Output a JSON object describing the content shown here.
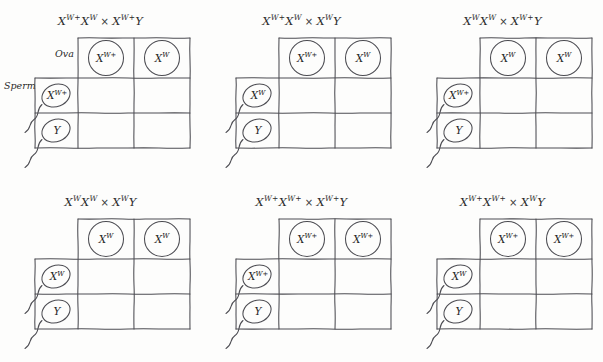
{
  "figure": {
    "title_style": "handwritten-genetics-punnett-squares",
    "columns": 3,
    "rows": 2,
    "axis_labels": {
      "ova": "Ova",
      "sperm": "Sperm"
    },
    "cross_symbol": "×",
    "colors": {
      "ink": "#4c4c52",
      "text": "#1f1f1f",
      "background": "#fdfdfc"
    }
  },
  "panels": [
    {
      "id": "panel-1",
      "title": {
        "maternal": [
          {
            "base": "X",
            "sup": "W+"
          },
          {
            "base": "X",
            "sup": "W"
          }
        ],
        "paternal": [
          {
            "base": "X",
            "sup": "W+"
          },
          {
            "base": "Y",
            "sup": ""
          }
        ],
        "plain": "XW+XW × XW+Y"
      },
      "show_axis_labels": true,
      "ova": [
        {
          "base": "X",
          "sup": "W+"
        },
        {
          "base": "X",
          "sup": "W"
        }
      ],
      "sperm": [
        {
          "base": "X",
          "sup": "W+"
        },
        {
          "base": "Y",
          "sup": ""
        }
      ],
      "cells": [
        [
          "",
          ""
        ],
        [
          "",
          ""
        ]
      ]
    },
    {
      "id": "panel-2",
      "title": {
        "maternal": [
          {
            "base": "X",
            "sup": "W+"
          },
          {
            "base": "X",
            "sup": "W"
          }
        ],
        "paternal": [
          {
            "base": "X",
            "sup": "W"
          },
          {
            "base": "Y",
            "sup": ""
          }
        ],
        "plain": "XW+XW × XWY"
      },
      "show_axis_labels": false,
      "ova": [
        {
          "base": "X",
          "sup": "W+"
        },
        {
          "base": "X",
          "sup": "W"
        }
      ],
      "sperm": [
        {
          "base": "X",
          "sup": "W"
        },
        {
          "base": "Y",
          "sup": ""
        }
      ],
      "cells": [
        [
          "",
          ""
        ],
        [
          "",
          ""
        ]
      ]
    },
    {
      "id": "panel-3",
      "title": {
        "maternal": [
          {
            "base": "X",
            "sup": "W"
          },
          {
            "base": "X",
            "sup": "W"
          }
        ],
        "paternal": [
          {
            "base": "X",
            "sup": "W+"
          },
          {
            "base": "Y",
            "sup": ""
          }
        ],
        "plain": "XWXW × XW+Y"
      },
      "show_axis_labels": false,
      "ova": [
        {
          "base": "X",
          "sup": "W"
        },
        {
          "base": "X",
          "sup": "W"
        }
      ],
      "sperm": [
        {
          "base": "X",
          "sup": "W+"
        },
        {
          "base": "Y",
          "sup": ""
        }
      ],
      "cells": [
        [
          "",
          ""
        ],
        [
          "",
          ""
        ]
      ]
    },
    {
      "id": "panel-4",
      "title": {
        "maternal": [
          {
            "base": "X",
            "sup": "W"
          },
          {
            "base": "X",
            "sup": "W"
          }
        ],
        "paternal": [
          {
            "base": "X",
            "sup": "W"
          },
          {
            "base": "Y",
            "sup": ""
          }
        ],
        "plain": "XWXW × XWY"
      },
      "show_axis_labels": false,
      "ova": [
        {
          "base": "X",
          "sup": "W"
        },
        {
          "base": "X",
          "sup": "W"
        }
      ],
      "sperm": [
        {
          "base": "X",
          "sup": "W"
        },
        {
          "base": "Y",
          "sup": ""
        }
      ],
      "cells": [
        [
          "",
          ""
        ],
        [
          "",
          ""
        ]
      ]
    },
    {
      "id": "panel-5",
      "title": {
        "maternal": [
          {
            "base": "X",
            "sup": "W+"
          },
          {
            "base": "X",
            "sup": "W+"
          }
        ],
        "paternal": [
          {
            "base": "X",
            "sup": "W+"
          },
          {
            "base": "Y",
            "sup": ""
          }
        ],
        "plain": "XW+XW+ × XW+Y"
      },
      "show_axis_labels": false,
      "ova": [
        {
          "base": "X",
          "sup": "W+"
        },
        {
          "base": "X",
          "sup": "W+"
        }
      ],
      "sperm": [
        {
          "base": "X",
          "sup": "W+"
        },
        {
          "base": "Y",
          "sup": ""
        }
      ],
      "cells": [
        [
          "",
          ""
        ],
        [
          "",
          ""
        ]
      ]
    },
    {
      "id": "panel-6",
      "title": {
        "maternal": [
          {
            "base": "X",
            "sup": "W+"
          },
          {
            "base": "X",
            "sup": "W+"
          }
        ],
        "paternal": [
          {
            "base": "X",
            "sup": "W"
          },
          {
            "base": "Y",
            "sup": ""
          }
        ],
        "plain": "XW+XW+ × XWY"
      },
      "show_axis_labels": false,
      "ova": [
        {
          "base": "X",
          "sup": "W+"
        },
        {
          "base": "X",
          "sup": "W+"
        }
      ],
      "sperm": [
        {
          "base": "X",
          "sup": "W"
        },
        {
          "base": "Y",
          "sup": ""
        }
      ],
      "cells": [
        [
          "",
          ""
        ],
        [
          "",
          ""
        ]
      ]
    }
  ]
}
